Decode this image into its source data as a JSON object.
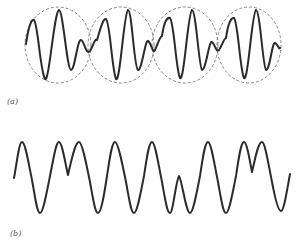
{
  "figure": {
    "panel_a": {
      "label": "(a)",
      "description": "Wave with beat envelopes (dashed ellipses)",
      "envelopes": [
        {
          "cx": 58,
          "cy": 45,
          "rx": 33,
          "ry": 38
        },
        {
          "cx": 121,
          "cy": 45,
          "rx": 33,
          "ry": 38
        },
        {
          "cx": 185,
          "cy": 45,
          "rx": 33,
          "ry": 38
        },
        {
          "cx": 249,
          "cy": 45,
          "rx": 32,
          "ry": 38
        }
      ],
      "envelope_count": 4
    },
    "panel_b": {
      "label": "(b)",
      "description": "Waveform with notched peaks"
    },
    "colors": {
      "line": "#2a2a2a",
      "envelope": "#777777",
      "label": "#555555"
    }
  }
}
